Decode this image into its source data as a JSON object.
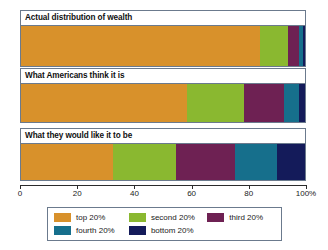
{
  "chart_data": {
    "type": "bar",
    "orientation": "horizontal",
    "stacked": true,
    "stacked_normalized": true,
    "title": "",
    "subtitle": "",
    "xlabel": "",
    "ylabel": "",
    "xlim": [
      0,
      100
    ],
    "grid": false,
    "legend_position": "bottom",
    "categories": [
      "Actual distribution of wealth",
      "What Americans think it is",
      "What they would like it to be"
    ],
    "series": [
      {
        "name": "top 20%",
        "color": "#d8912b",
        "values": [
          84.0,
          58.5,
          32.5
        ]
      },
      {
        "name": "second 20%",
        "color": "#8ab830",
        "values": [
          10.0,
          20.0,
          22.0
        ]
      },
      {
        "name": "third 20%",
        "color": "#6e2153",
        "values": [
          4.0,
          14.0,
          21.0
        ]
      },
      {
        "name": "fourth 20%",
        "color": "#166f8c",
        "values": [
          1.2,
          5.5,
          14.5
        ]
      },
      {
        "name": "bottom 20%",
        "color": "#141b5a",
        "values": [
          0.8,
          2.0,
          10.0
        ]
      }
    ],
    "xticks": [
      0,
      20,
      40,
      60,
      80,
      100
    ],
    "xticklabels": [
      "0",
      "20",
      "40",
      "60",
      "80",
      "100%"
    ],
    "legend_entries": [
      {
        "label": "top 20%",
        "color": "#d8912b"
      },
      {
        "label": "second 20%",
        "color": "#8ab830"
      },
      {
        "label": "third 20%",
        "color": "#6e2153"
      },
      {
        "label": "fourth 20%",
        "color": "#166f8c"
      },
      {
        "label": "bottom 20%",
        "color": "#141b5a"
      }
    ]
  }
}
